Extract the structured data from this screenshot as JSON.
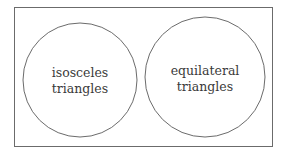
{
  "diagram": {
    "type": "venn",
    "universe": {
      "label": ""
    },
    "sets": [
      {
        "label_line1": "isosceles",
        "label_line2": "triangles"
      },
      {
        "label_line1": "equilateral",
        "label_line2": "triangles"
      }
    ],
    "colors": {
      "stroke": "#6b6b6b",
      "text": "#3a3a3a",
      "background": "#ffffff"
    }
  }
}
